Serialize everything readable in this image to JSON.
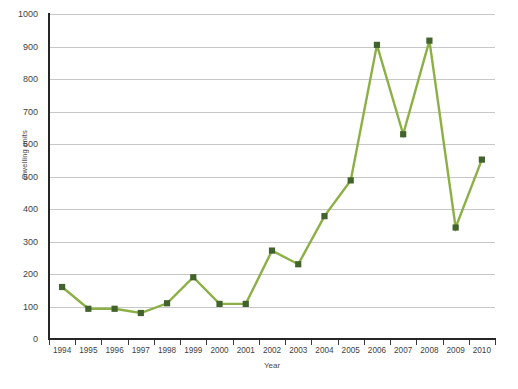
{
  "chart_data": {
    "type": "line",
    "title": "",
    "xlabel": "Year",
    "ylabel": "Dwelling units",
    "categories": [
      "1994",
      "1995",
      "1996",
      "1997",
      "1998",
      "1999",
      "2000",
      "2001",
      "2002",
      "2003",
      "2004",
      "2005",
      "2006",
      "2007",
      "2008",
      "2009",
      "2010"
    ],
    "values": [
      160,
      93,
      93,
      80,
      110,
      190,
      108,
      108,
      272,
      230,
      378,
      488,
      905,
      630,
      918,
      343,
      552
    ],
    "series": [
      {
        "name": "Dwelling units",
        "values": [
          160,
          93,
          93,
          80,
          110,
          190,
          108,
          108,
          272,
          230,
          378,
          488,
          905,
          630,
          918,
          343,
          552
        ]
      }
    ],
    "ylim": [
      0,
      1000
    ],
    "y_ticks": [
      0,
      100,
      200,
      300,
      400,
      500,
      600,
      700,
      800,
      900,
      1000
    ],
    "y_tick_labels": [
      "0",
      "100",
      "200",
      "300",
      "400",
      "500",
      "600",
      "700",
      "800",
      "900",
      "1000"
    ],
    "grid": "horizontal",
    "legend": "none",
    "line_color": "#8CAF46",
    "marker_color": "#43632C",
    "gridline_color": "#C8C8C8",
    "axis_color": "#262626"
  },
  "caption": {
    "text": ""
  }
}
